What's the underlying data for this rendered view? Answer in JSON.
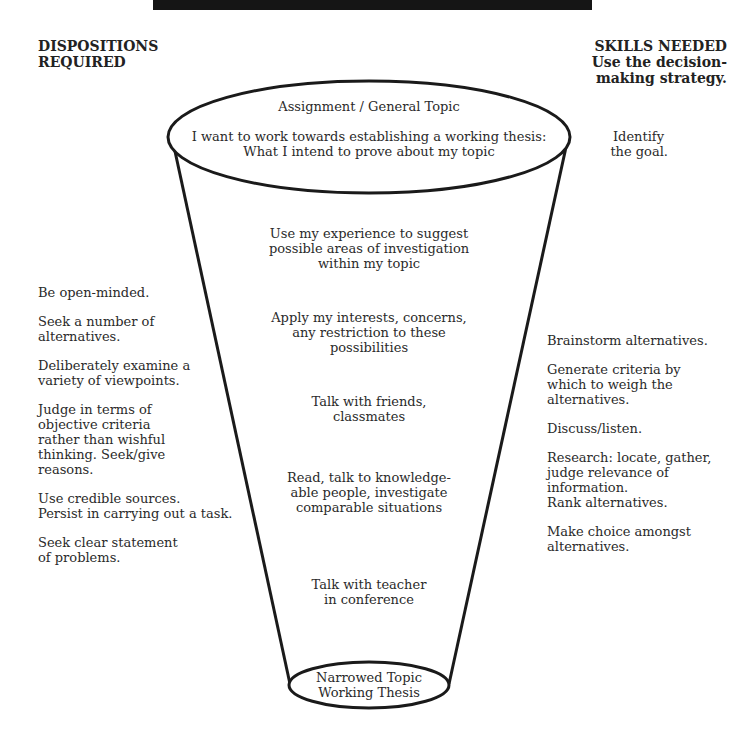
{
  "banner": {
    "text": ""
  },
  "headers": {
    "left": {
      "line1": "DISPOSITIONS",
      "line2": "REQUIRED"
    },
    "right": {
      "line1": "SKILLS NEEDED",
      "line2": "Use the decision-",
      "line3": "making strategy."
    }
  },
  "funnel": {
    "top_ellipse": {
      "title": "Assignment / General Topic",
      "line1": "I want to work towards establishing a working thesis:",
      "line2": "What I intend to prove about my topic"
    },
    "steps": [
      {
        "lines": [
          "Use my experience to suggest",
          "possible areas of investigation",
          "within my topic"
        ]
      },
      {
        "lines": [
          "Apply my interests, concerns,",
          "any restriction to these",
          "possibilities"
        ]
      },
      {
        "lines": [
          "Talk with friends,",
          "classmates"
        ]
      },
      {
        "lines": [
          "Read, talk to knowledge-",
          "able people, investigate",
          "comparable situations"
        ]
      },
      {
        "lines": [
          "Talk with teacher",
          "in conference"
        ]
      }
    ],
    "bottom_ellipse": {
      "line1": "Narrowed Topic",
      "line2": "Working Thesis"
    }
  },
  "goal": {
    "line1": "Identify",
    "line2": "the goal."
  },
  "dispositions": [
    [
      "Be open-minded."
    ],
    [
      "Seek a number of",
      "alternatives."
    ],
    [
      "Deliberately examine a",
      "variety of viewpoints."
    ],
    [
      "Judge in terms of",
      "objective criteria",
      "rather than wishful",
      "thinking. Seek/give",
      "reasons."
    ],
    [
      "Use credible sources.",
      "Persist in carrying out a task."
    ],
    [
      "Seek clear statement",
      "of problems."
    ]
  ],
  "skills": [
    [
      "Brainstorm alternatives."
    ],
    [
      "Generate criteria by",
      "which to weigh the",
      "alternatives."
    ],
    [
      "Discuss/listen."
    ],
    [
      "Research: locate, gather,",
      "judge relevance of",
      "information.",
      "Rank alternatives."
    ],
    [
      "Make choice amongst",
      "alternatives."
    ]
  ],
  "colors": {
    "banner": "#151515",
    "stroke": "#1a1a1a",
    "text": "#2a2a2a"
  }
}
